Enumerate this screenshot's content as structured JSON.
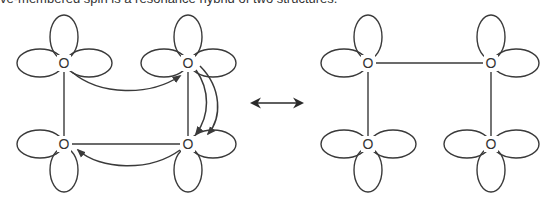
{
  "caption": "ve-membered spin is a resonance hybrid of two structures.",
  "resonance_arrow": {
    "symbol": "double-headed-arrow"
  },
  "structures": [
    {
      "name": "left-structure",
      "atoms": [
        {
          "label": "O",
          "position": "top-left"
        },
        {
          "label": "O",
          "position": "top-right"
        },
        {
          "label": "O",
          "position": "bottom-left"
        },
        {
          "label": "O",
          "position": "bottom-right"
        }
      ],
      "bonds": [
        "top-left–bottom-left",
        "top-right–bottom-right",
        "bottom-left–bottom-right"
      ],
      "curved_arrows": [
        "top-left → top-right",
        "top-right → bottom-right",
        "top-right → bottom-right",
        "bottom-right → bottom-left"
      ]
    },
    {
      "name": "right-structure",
      "atoms": [
        {
          "label": "O",
          "position": "top-left"
        },
        {
          "label": "O",
          "position": "top-right"
        },
        {
          "label": "O",
          "position": "bottom-left"
        },
        {
          "label": "O",
          "position": "bottom-right"
        }
      ],
      "bonds": [
        "top-left–top-right",
        "top-left–bottom-left",
        "top-right–bottom-right"
      ]
    }
  ]
}
